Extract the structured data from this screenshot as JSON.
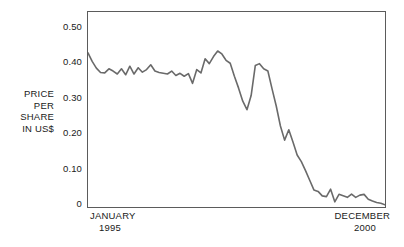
{
  "chart_data": {
    "type": "line",
    "title": "",
    "xlabel": "",
    "ylabel": "PRICE PER SHARE IN US$",
    "ylabel_lines": [
      "PRICE",
      "PER",
      "SHARE",
      "IN US$"
    ],
    "ylim": [
      0,
      0.525
    ],
    "yticks": [
      "0.50",
      "0.40",
      "0.30",
      "0.20",
      "0.10",
      "0"
    ],
    "ytick_values": [
      0.5,
      0.4,
      0.3,
      0.2,
      0.1,
      0
    ],
    "xtick_start": {
      "line1": "JANUARY",
      "line2": "1995"
    },
    "xtick_end": {
      "line1": "DECEMBER",
      "line2": "2000"
    },
    "xlim": [
      0,
      71
    ],
    "grid": false,
    "legend": "none",
    "line_color": "#6a6a6a",
    "axis_color": "#5b5b5b",
    "text_color": "#1a1a1a",
    "series": [
      {
        "name": "Price per share",
        "x": [
          0,
          1,
          2,
          3,
          4,
          5,
          6,
          7,
          8,
          9,
          10,
          11,
          12,
          13,
          14,
          15,
          16,
          17,
          18,
          19,
          20,
          21,
          22,
          23,
          24,
          25,
          26,
          27,
          28,
          29,
          30,
          31,
          32,
          33,
          34,
          35,
          36,
          37,
          38,
          39,
          40,
          41,
          42,
          43,
          44,
          45,
          46,
          47,
          48,
          49,
          50,
          51,
          52,
          53,
          54,
          55,
          56,
          57,
          58,
          59,
          60,
          61,
          62,
          63,
          64,
          65,
          66,
          67,
          68,
          69,
          70,
          71
        ],
        "values": [
          0.415,
          0.392,
          0.374,
          0.362,
          0.361,
          0.372,
          0.366,
          0.358,
          0.372,
          0.356,
          0.379,
          0.358,
          0.375,
          0.363,
          0.37,
          0.383,
          0.366,
          0.362,
          0.36,
          0.358,
          0.366,
          0.354,
          0.36,
          0.352,
          0.359,
          0.333,
          0.37,
          0.361,
          0.399,
          0.386,
          0.405,
          0.42,
          0.412,
          0.395,
          0.387,
          0.352,
          0.32,
          0.285,
          0.262,
          0.3,
          0.381,
          0.386,
          0.372,
          0.366,
          0.318,
          0.272,
          0.218,
          0.18,
          0.208,
          0.175,
          0.14,
          0.122,
          0.098,
          0.072,
          0.046,
          0.042,
          0.03,
          0.028,
          0.048,
          0.014,
          0.034,
          0.03,
          0.026,
          0.035,
          0.026,
          0.032,
          0.034,
          0.021,
          0.016,
          0.012,
          0.01,
          0.006
        ]
      }
    ]
  }
}
